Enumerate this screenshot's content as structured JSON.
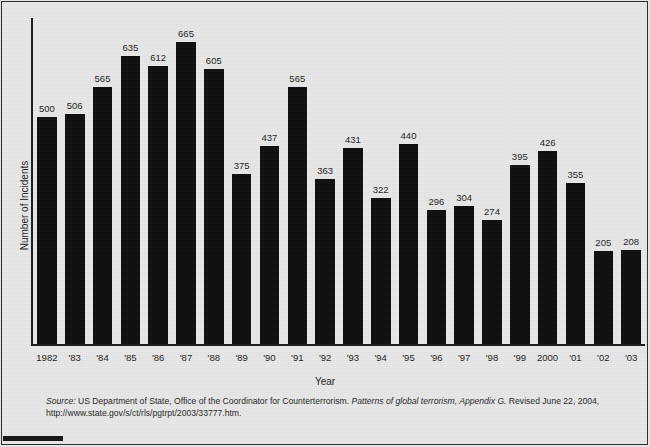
{
  "chart_data": {
    "type": "bar",
    "title": "",
    "xlabel": "Year",
    "ylabel": "Number of Incidents",
    "categories": [
      "1982",
      "'83",
      "'84",
      "'85",
      "'86",
      "'87",
      "'88",
      "'89",
      "'90",
      "'91",
      "'92",
      "'93",
      "'94",
      "'95",
      "'96",
      "'97",
      "'98",
      "'99",
      "2000",
      "'01",
      "'02",
      "'03"
    ],
    "years_full": [
      1982,
      1983,
      1984,
      1985,
      1986,
      1987,
      1988,
      1989,
      1990,
      1991,
      1992,
      1993,
      1994,
      1995,
      1996,
      1997,
      1998,
      1999,
      2000,
      2001,
      2002,
      2003
    ],
    "values": [
      500,
      506,
      565,
      635,
      612,
      665,
      605,
      375,
      437,
      565,
      363,
      431,
      322,
      440,
      296,
      304,
      274,
      395,
      426,
      355,
      205,
      208
    ],
    "ylim": [
      0,
      665
    ],
    "grid": false,
    "legend": false,
    "bar_color": "#0d0d0d",
    "background_color": "#e8e8e8",
    "axis_color": "#1a1a1a",
    "data_labels": true
  },
  "source": {
    "label": "Source:",
    "line1_body": " US Department of State, Office of the Coordinator for Counterterrorism. ",
    "italic_title": "Patterns of global terrorism,",
    "appendix": " Appendix G.",
    "line1_tail": " Revised June 22, 2004, http://www.",
    "line2": "state.gov/s/ct/rls/pgtrpt/2003/33777.htm."
  }
}
